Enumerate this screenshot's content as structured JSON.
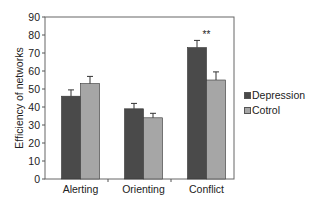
{
  "chart_data": {
    "type": "bar",
    "title": "",
    "xlabel": "",
    "ylabel": "Efficiency of networks",
    "ylim": [
      0,
      90
    ],
    "yticks": [
      0,
      10,
      20,
      30,
      40,
      50,
      60,
      70,
      80,
      90
    ],
    "grid": false,
    "legend_position": "right",
    "categories": [
      "Alerting",
      "Orienting",
      "Conflict"
    ],
    "series": [
      {
        "name": "Depression",
        "color": "#4a4a4a",
        "values": [
          46,
          39,
          73
        ],
        "errors": [
          3.5,
          3,
          4
        ]
      },
      {
        "name": "Cotrol",
        "color": "#a6a6a6",
        "values": [
          53,
          34,
          55
        ],
        "errors": [
          4,
          2.5,
          4.5
        ]
      }
    ],
    "annotations": [
      {
        "category": "Conflict",
        "text": "**"
      }
    ]
  }
}
